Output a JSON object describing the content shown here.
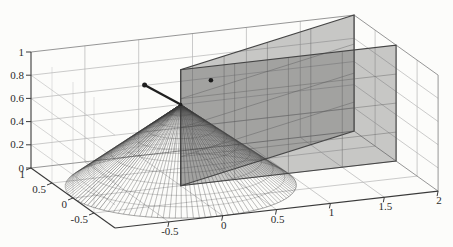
{
  "figure": {
    "width": 453,
    "height": 247,
    "background": "#fcfcfa"
  },
  "chart_data": {
    "type": "surface3d",
    "title": "",
    "view": {
      "origin": [
        180.7,
        185.7
      ],
      "ex": [
        107.7,
        -12.3
      ],
      "ey": [
        -42,
        -30
      ],
      "ez": [
        0,
        -116
      ]
    },
    "axes": {
      "xlim": [
        -1,
        2
      ],
      "ylim": [
        -1,
        1
      ],
      "zlim": [
        0,
        1
      ],
      "xticks": [
        -0.5,
        0,
        0.5,
        1,
        1.5,
        2
      ],
      "xtick_labels": [
        "-0.5",
        "0",
        "0.5",
        "1",
        "1.5",
        "2"
      ],
      "yticks": [
        1,
        0.5,
        0,
        -0.5
      ],
      "ytick_labels": [
        "1",
        "0.5",
        "0",
        "-0.5"
      ],
      "zticks": [
        0,
        0.2,
        0.4,
        0.6,
        0.8,
        1
      ],
      "ztick_labels": [
        "0",
        "0.2",
        "0.4",
        "0.6",
        "0.8",
        "1"
      ],
      "grid": true,
      "inner_xgrid": [
        -0.5,
        0,
        0.5,
        1,
        1.5
      ],
      "inner_ygrid": [
        0.5,
        0,
        -0.5
      ],
      "inner_zgrid": [
        0.2,
        0.4,
        0.6,
        0.8
      ]
    },
    "surfaces": [
      {
        "name": "cone",
        "type": "cone",
        "apex": [
          0,
          0,
          0.7
        ],
        "base_center": [
          0,
          0,
          0
        ],
        "base_radius": 1,
        "n_radial": 120,
        "rings": [
          0.1,
          0.2,
          0.3,
          0.4,
          0.5,
          0.6,
          0.7,
          0.8,
          0.9,
          1
        ]
      },
      {
        "name": "plane-b",
        "type": "plane",
        "corners": [
          [
            0,
            0,
            0
          ],
          [
            0,
            0,
            1
          ],
          [
            2,
            1,
            1
          ],
          [
            2,
            1,
            0
          ]
        ],
        "grid_fractions": [
          0.25,
          0.5,
          0.75
        ]
      },
      {
        "name": "plane-a",
        "type": "plane",
        "corners": [
          [
            0,
            0,
            0
          ],
          [
            0,
            0,
            1
          ],
          [
            2,
            0,
            1
          ],
          [
            2,
            0,
            0
          ]
        ],
        "grid_fractions": [
          0.25,
          0.5,
          0.75
        ]
      }
    ],
    "annotations": {
      "arrow": {
        "from": [
          0,
          0,
          0.7
        ],
        "to": [
          -0.07,
          0.68,
          0.7
        ]
      },
      "points": [
        [
          0.28,
          0,
          0.88
        ]
      ]
    },
    "colors": {
      "background": "#fcfcfa",
      "grid_line": "#b5b5b5",
      "box_edge": "#8a8a8a",
      "axis_line": "#3a3a3a",
      "label": "#2b2b2b",
      "plane_fill": "rgba(75,75,75,0.30)",
      "plane_edge": "#454545",
      "plane_grid": "#5f5f5f",
      "cone_line": "#383838",
      "arrow": "#1f1f1f",
      "marker": "#1a1a1a"
    }
  }
}
